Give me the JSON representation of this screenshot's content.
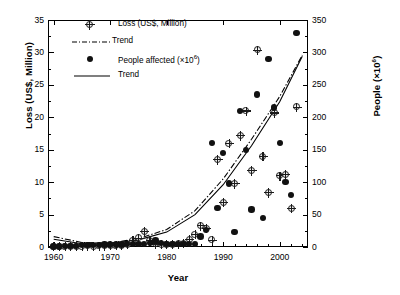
{
  "chart_data": {
    "type": "scatter",
    "title": "",
    "xlabel": "Year",
    "ylabel": "Loss (US$, Million)",
    "ylabel_right": "People (×10⁶)",
    "xlim": [
      1959,
      2005
    ],
    "ylim": [
      0,
      35
    ],
    "ylim_right": [
      0,
      350
    ],
    "xticks": [
      1960,
      1970,
      1980,
      1990,
      2000
    ],
    "yticks": [
      0,
      5,
      10,
      15,
      20,
      25,
      30,
      35
    ],
    "yticks_right": [
      0,
      50,
      100,
      150,
      200,
      250,
      300,
      350
    ],
    "grid": false,
    "legend_position": "top-left",
    "legend": [
      {
        "label": "Loss (US$, Million)",
        "marker": "circle-cross-open",
        "color": "#f2f2f2"
      },
      {
        "label": "Trend",
        "marker": "line-dash-dot",
        "color": "#000000"
      },
      {
        "label": "People affected (×10⁶)",
        "marker": "circle-filled",
        "color": "#111111"
      },
      {
        "label": "Trend",
        "marker": "line-solid",
        "color": "#000000"
      }
    ],
    "series": [
      {
        "name": "Loss (US$, Million)",
        "marker": "circle-cross-open",
        "points": [
          [
            1960,
            0.1
          ],
          [
            1961,
            0.1
          ],
          [
            1962,
            0.1
          ],
          [
            1963,
            0.1
          ],
          [
            1964,
            0.15
          ],
          [
            1965,
            0.15
          ],
          [
            1966,
            0.2
          ],
          [
            1967,
            0.15
          ],
          [
            1968,
            0.2
          ],
          [
            1969,
            0.2
          ],
          [
            1970,
            0.25
          ],
          [
            1971,
            0.3
          ],
          [
            1972,
            0.3
          ],
          [
            1973,
            0.4
          ],
          [
            1974,
            1.0
          ],
          [
            1975,
            1.4
          ],
          [
            1976,
            2.4
          ],
          [
            1977,
            1.0
          ],
          [
            1978,
            0.5
          ],
          [
            1979,
            0.4
          ],
          [
            1980,
            0.4
          ],
          [
            1981,
            0.4
          ],
          [
            1982,
            0.5
          ],
          [
            1983,
            0.6
          ],
          [
            1984,
            1.2
          ],
          [
            1985,
            2.0
          ],
          [
            1986,
            3.3
          ],
          [
            1987,
            2.9
          ],
          [
            1988,
            1.1
          ],
          [
            1989,
            13.5
          ],
          [
            1990,
            6.9
          ],
          [
            1991,
            16.0
          ],
          [
            1992,
            9.8
          ],
          [
            1993,
            17.2
          ],
          [
            1994,
            21.0
          ],
          [
            1995,
            11.8
          ],
          [
            1996,
            30.4
          ],
          [
            1997,
            14.0
          ],
          [
            1998,
            8.4
          ],
          [
            1999,
            20.7
          ],
          [
            2000,
            11.0
          ],
          [
            2001,
            11.2
          ],
          [
            2002,
            6.0
          ],
          [
            2003,
            21.6
          ]
        ]
      },
      {
        "name": "People affected (×10⁶)",
        "marker": "circle-filled",
        "points": [
          [
            1960,
            1
          ],
          [
            1961,
            1
          ],
          [
            1962,
            2
          ],
          [
            1963,
            2
          ],
          [
            1964,
            2
          ],
          [
            1965,
            3
          ],
          [
            1966,
            3
          ],
          [
            1967,
            3
          ],
          [
            1968,
            3
          ],
          [
            1969,
            4
          ],
          [
            1970,
            4
          ],
          [
            1971,
            4
          ],
          [
            1972,
            4
          ],
          [
            1973,
            5
          ],
          [
            1974,
            5
          ],
          [
            1975,
            5
          ],
          [
            1976,
            5
          ],
          [
            1977,
            6
          ],
          [
            1978,
            10
          ],
          [
            1979,
            6
          ],
          [
            1980,
            5
          ],
          [
            1981,
            5
          ],
          [
            1982,
            5
          ],
          [
            1983,
            5
          ],
          [
            1984,
            5
          ],
          [
            1985,
            5
          ],
          [
            1986,
            16
          ],
          [
            1987,
            26
          ],
          [
            1988,
            160
          ],
          [
            1989,
            60
          ],
          [
            1990,
            145
          ],
          [
            1991,
            98
          ],
          [
            1992,
            23
          ],
          [
            1993,
            210
          ],
          [
            1994,
            150
          ],
          [
            1995,
            58
          ],
          [
            1996,
            235
          ],
          [
            1997,
            45
          ],
          [
            1998,
            290
          ],
          [
            1999,
            215
          ],
          [
            2000,
            160
          ],
          [
            2001,
            100
          ],
          [
            2002,
            80
          ],
          [
            2003,
            330
          ]
        ]
      }
    ],
    "trends": [
      {
        "name": "Trend (Loss)",
        "style": "dash-dot",
        "points": [
          [
            1960,
            1.6
          ],
          [
            1965,
            0.7
          ],
          [
            1970,
            0.6
          ],
          [
            1975,
            1.3
          ],
          [
            1980,
            2.7
          ],
          [
            1985,
            5.6
          ],
          [
            1990,
            10.5
          ],
          [
            1995,
            16.6
          ],
          [
            2000,
            23.2
          ],
          [
            2004,
            29.6
          ]
        ]
      },
      {
        "name": "Trend (People affected)",
        "style": "solid",
        "points": [
          [
            1960,
            1.2
          ],
          [
            1965,
            0.5
          ],
          [
            1970,
            0.5
          ],
          [
            1975,
            1.1
          ],
          [
            1980,
            2.3
          ],
          [
            1985,
            5.0
          ],
          [
            1990,
            9.6
          ],
          [
            1995,
            15.6
          ],
          [
            2000,
            22.4
          ],
          [
            2004,
            29.4
          ]
        ]
      }
    ]
  }
}
